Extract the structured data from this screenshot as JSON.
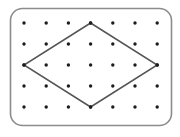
{
  "figure": {
    "canvas": {
      "width": 180,
      "height": 137,
      "background": "#ffffff"
    },
    "board": {
      "name": "geoboard-frame",
      "shape": "rounded-rectangle",
      "x": 10.5,
      "y": 8.5,
      "width": 161,
      "height": 117,
      "corner_radius": 12,
      "stroke_color": "#8c8c8c",
      "stroke_width": 1.6,
      "fill_color": "#ffffff"
    },
    "grid": {
      "name": "peg-grid",
      "columns": 7,
      "rows": 5,
      "x_positions": [
        24,
        46.2,
        68.4,
        90.6,
        112.8,
        135,
        157.2
      ],
      "y_positions": [
        23,
        44,
        65,
        86,
        107
      ],
      "dot_radius": 1.7,
      "dot_color": "#1c1c1c"
    },
    "shapes": [
      {
        "name": "rhombus",
        "type": "polygon",
        "vertices": [
          {
            "label": "top",
            "col": 3,
            "row": 0,
            "x": 90.6,
            "y": 23
          },
          {
            "label": "right",
            "col": 6,
            "row": 2,
            "x": 157.2,
            "y": 65
          },
          {
            "label": "bottom",
            "col": 3,
            "row": 4,
            "x": 90.6,
            "y": 107
          },
          {
            "label": "left",
            "col": 0,
            "row": 2,
            "x": 24,
            "y": 65
          }
        ],
        "stroke_color": "#555555",
        "stroke_width": 1.5,
        "fill": "none"
      }
    ]
  }
}
